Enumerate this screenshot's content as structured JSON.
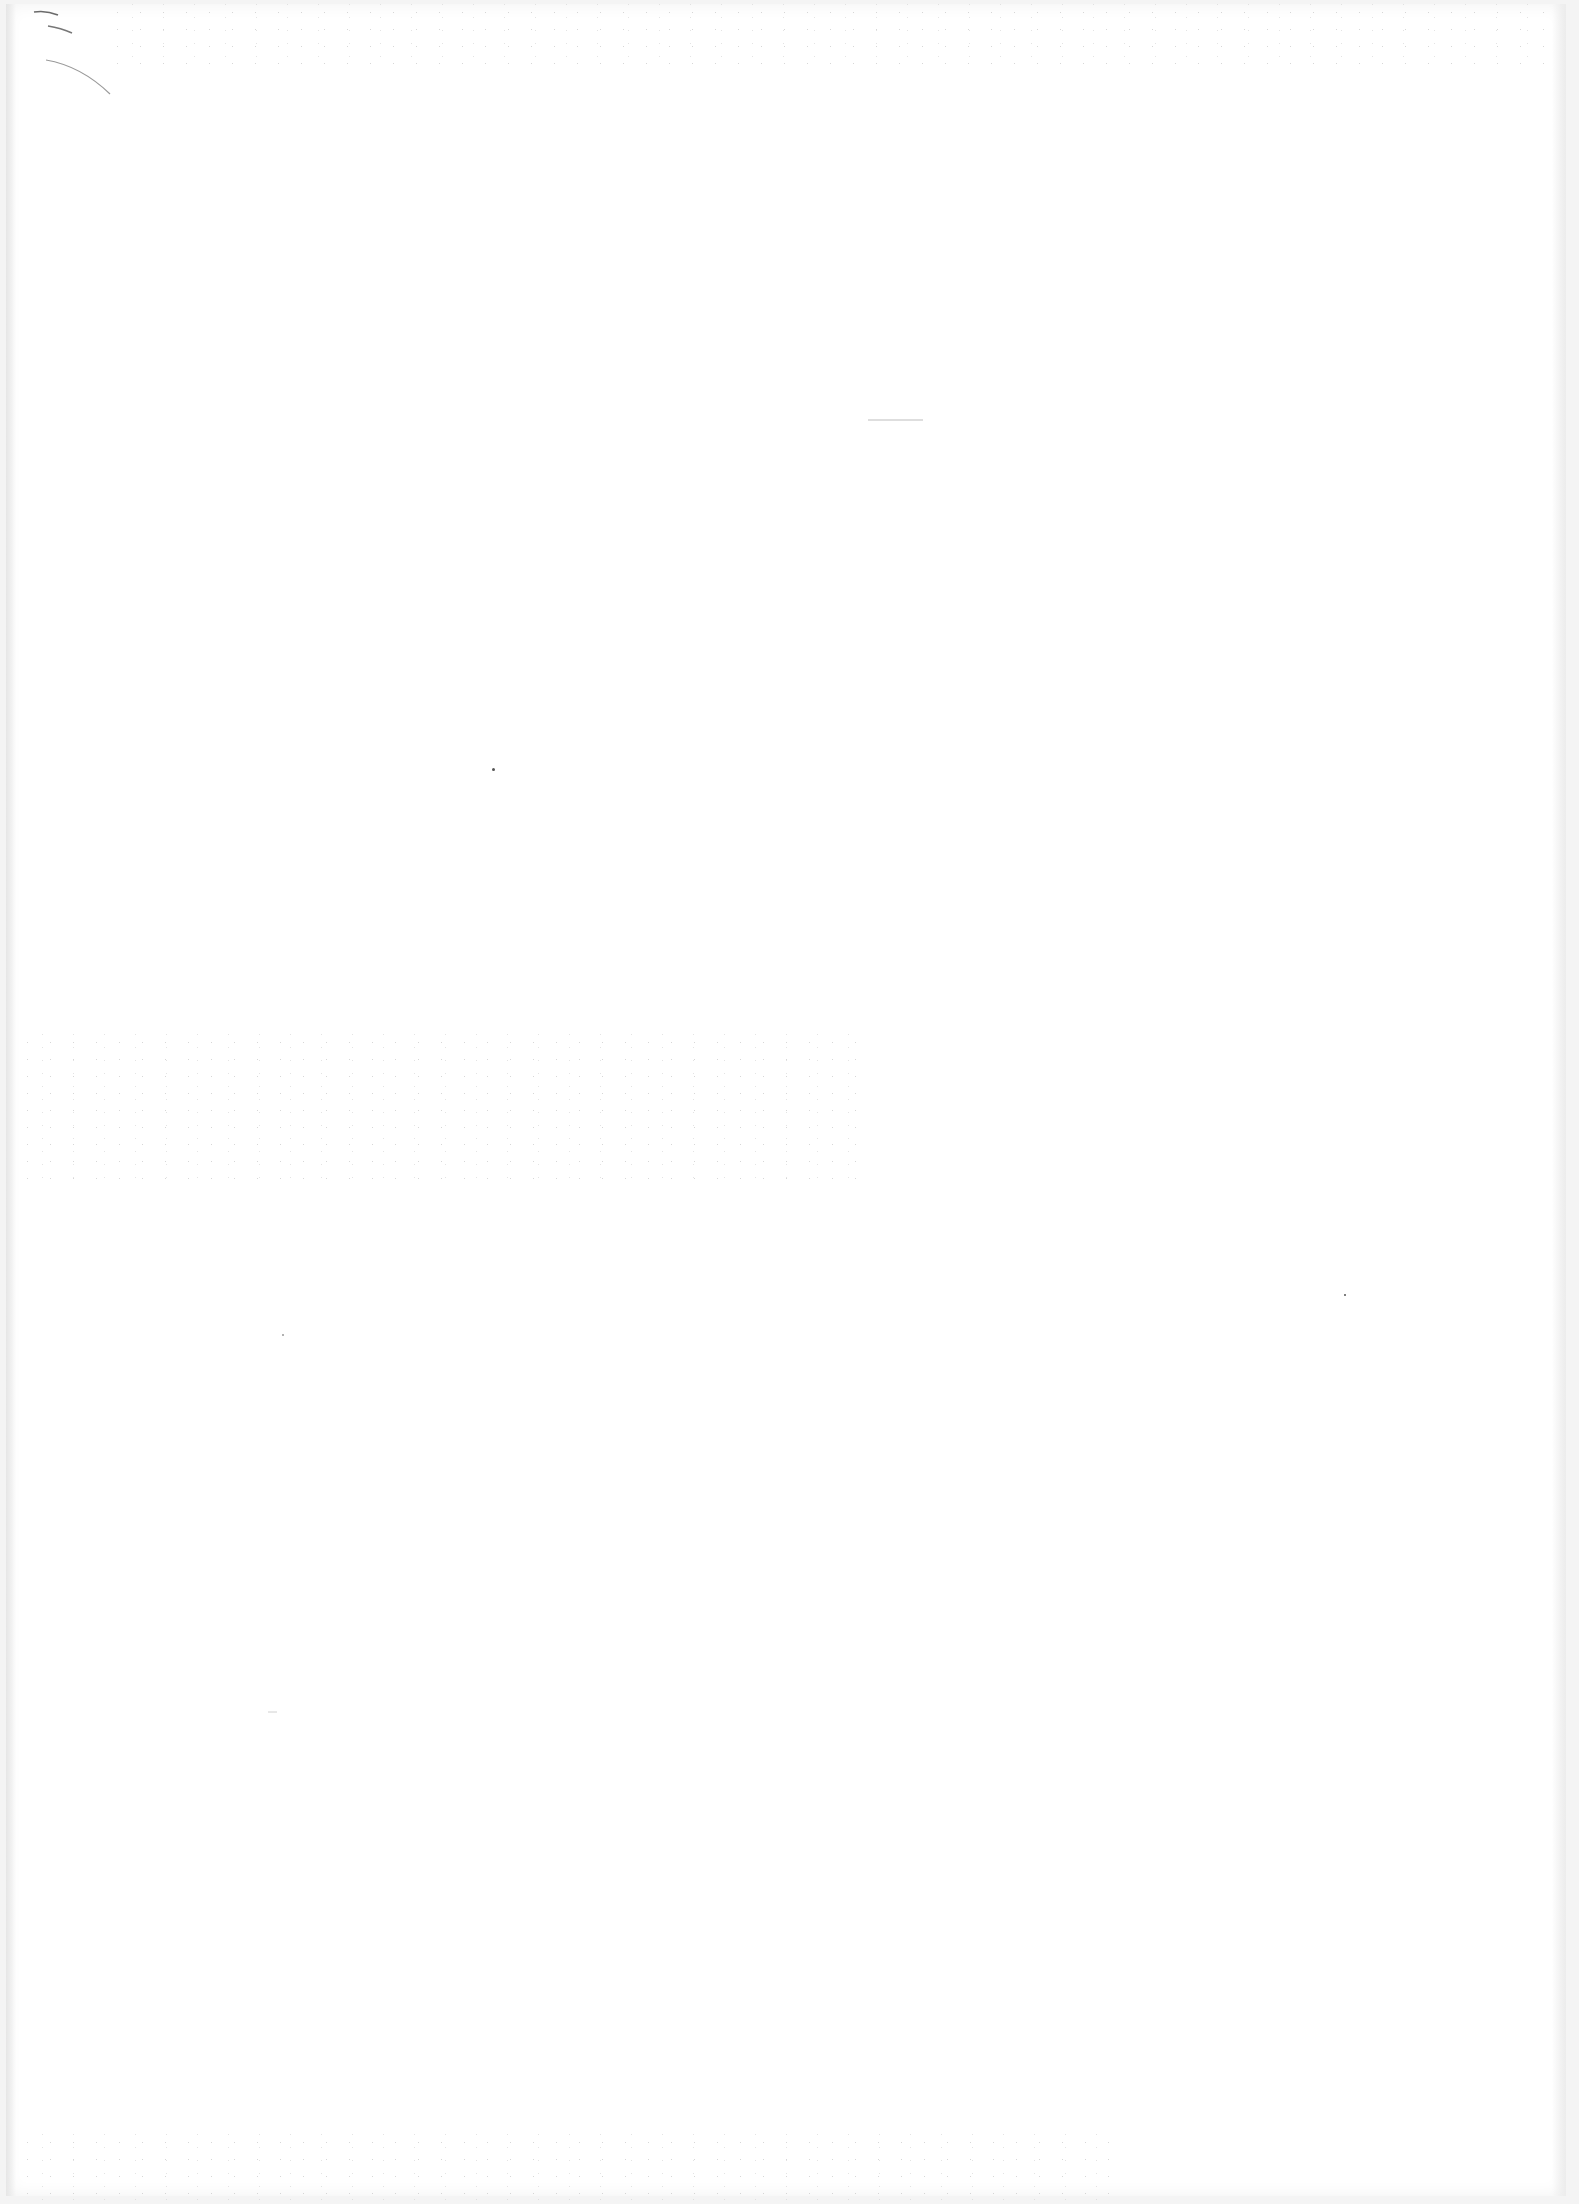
{
  "document": {
    "type": "blank-scanned-page",
    "text": "",
    "background_color": "#ffffff",
    "marks": [
      {
        "kind": "pen-stroke",
        "location": "top-left"
      },
      {
        "kind": "pen-stroke",
        "location": "top-left"
      },
      {
        "kind": "pen-stroke",
        "location": "top-left"
      },
      {
        "kind": "faint-line",
        "location": "top-center"
      }
    ],
    "page_number": ""
  }
}
